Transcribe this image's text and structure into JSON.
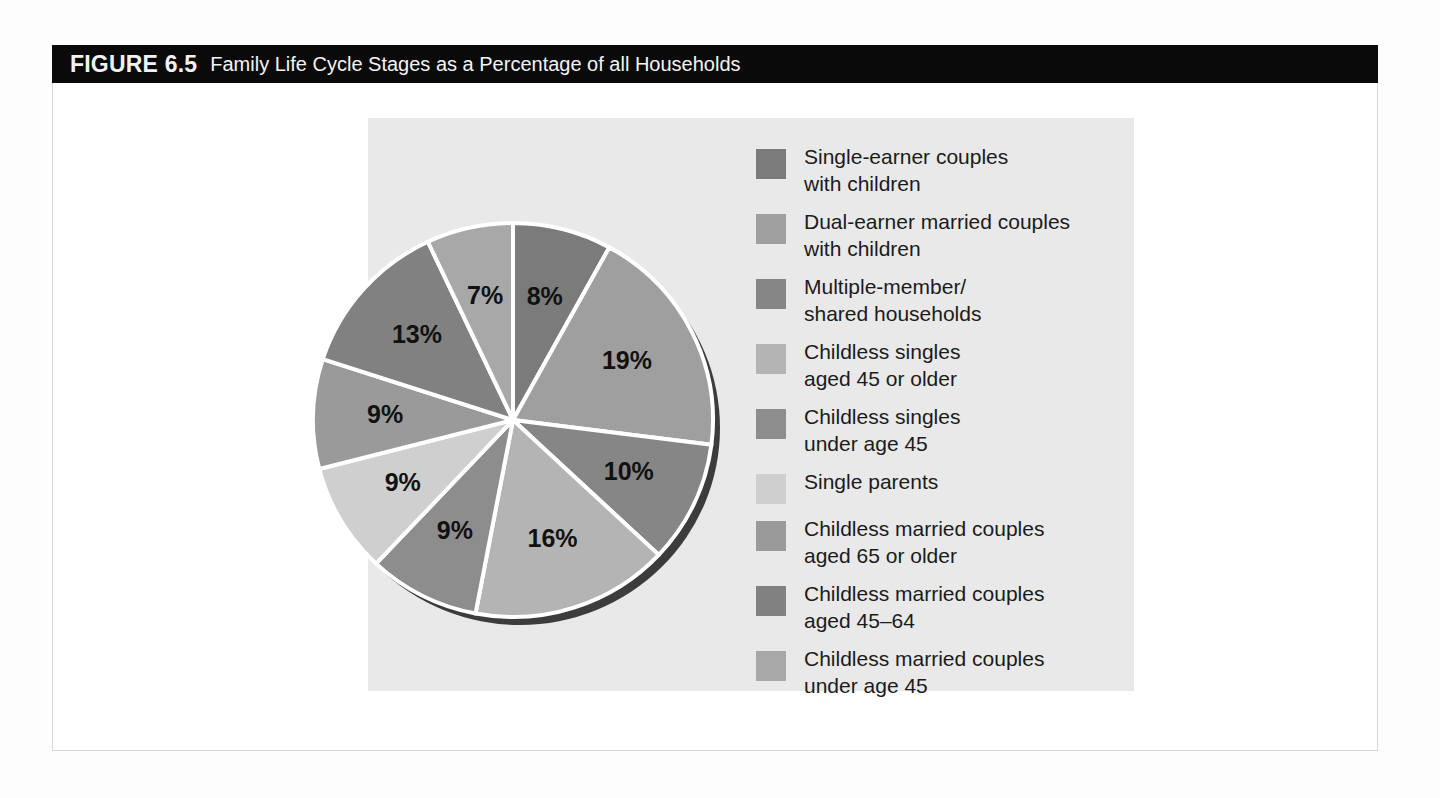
{
  "figure": {
    "number": "FIGURE 6.5",
    "title": "Family Life Cycle Stages as a Percentage of all Households"
  },
  "chart_data": {
    "type": "pie",
    "title": "Family Life Cycle Stages as a Percentage of all Households",
    "xlabel": "",
    "ylabel": "",
    "unit": "%",
    "legend_position": "right",
    "grid": false,
    "categories": [
      "Single-earner couples\nwith children",
      "Dual-earner married couples\nwith children",
      "Multiple-member/\nshared households",
      "Childless singles\naged 45 or older",
      "Childless singles\nunder age 45",
      "Single parents",
      "Childless married couples\naged 65 or older",
      "Childless married couples\naged 45–64",
      "Childless married couples\nunder age 45"
    ],
    "values": [
      8,
      19,
      10,
      16,
      9,
      9,
      9,
      13,
      7
    ],
    "labels": [
      "8%",
      "19%",
      "10%",
      "16%",
      "9%",
      "9%",
      "9%",
      "13%",
      "7%"
    ],
    "colors": [
      "#7b7b7b",
      "#9f9f9f",
      "#868686",
      "#b4b4b4",
      "#8d8d8d",
      "#cfcfcf",
      "#9a9a9a",
      "#818181",
      "#a8a8a8"
    ]
  },
  "legend": {
    "items": [
      {
        "label": "Single-earner couples\nwith children",
        "color": "#7b7b7b",
        "value": "8%"
      },
      {
        "label": "Dual-earner married couples\nwith children",
        "color": "#9f9f9f",
        "value": "19%"
      },
      {
        "label": "Multiple-member/\nshared households",
        "color": "#868686",
        "value": "10%"
      },
      {
        "label": "Childless singles\naged 45 or older",
        "color": "#b4b4b4",
        "value": "16%"
      },
      {
        "label": "Childless singles\nunder age 45",
        "color": "#8d8d8d",
        "value": "9%"
      },
      {
        "label": "Single parents",
        "color": "#cfcfcf",
        "value": "9%"
      },
      {
        "label": "Childless married couples\naged 65 or older",
        "color": "#9a9a9a",
        "value": "9%"
      },
      {
        "label": "Childless married couples\naged 45–64",
        "color": "#818181",
        "value": "13%"
      },
      {
        "label": "Childless married couples\nunder age 45",
        "color": "#a8a8a8",
        "value": "7%"
      }
    ]
  },
  "theme": {
    "header_background": "#0a0a0a",
    "header_text": "#f2f2f2",
    "panel_background": "#e9e9e9",
    "page_background": "#ffffff",
    "slice_divider": "#ffffff",
    "shadow": "#3c3c3c"
  }
}
